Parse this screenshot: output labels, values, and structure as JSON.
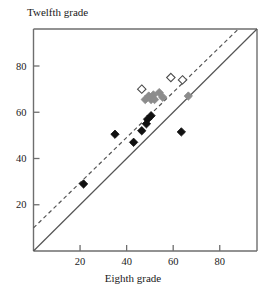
{
  "chart_data": {
    "type": "scatter",
    "title": "",
    "xlabel": "Eighth grade",
    "ylabel": "Twelfth grade",
    "xlim": [
      0,
      96
    ],
    "ylim": [
      0,
      96
    ],
    "xticks": [
      20,
      40,
      60,
      80
    ],
    "yticks": [
      20,
      40,
      60,
      80
    ],
    "grid": false,
    "legend": "none",
    "series": [
      {
        "name": "filled-diamond",
        "marker": "filled diamond",
        "color": "#111111",
        "points": [
          {
            "x": 21.5,
            "y": 29.0
          },
          {
            "x": 35.0,
            "y": 50.5
          },
          {
            "x": 43.0,
            "y": 47.0
          },
          {
            "x": 46.5,
            "y": 52.0
          },
          {
            "x": 48.5,
            "y": 55.0
          },
          {
            "x": 49.0,
            "y": 57.0
          },
          {
            "x": 50.5,
            "y": 58.5
          },
          {
            "x": 63.5,
            "y": 51.5
          }
        ]
      },
      {
        "name": "gray-diamond",
        "marker": "gray filled diamond",
        "color": "#8c8c8c",
        "points": [
          {
            "x": 48.0,
            "y": 65.5
          },
          {
            "x": 49.5,
            "y": 67.0
          },
          {
            "x": 50.5,
            "y": 65.5
          },
          {
            "x": 51.5,
            "y": 67.5
          },
          {
            "x": 52.0,
            "y": 65.5
          },
          {
            "x": 54.0,
            "y": 68.5
          },
          {
            "x": 55.5,
            "y": 66.5
          },
          {
            "x": 66.5,
            "y": 67.0
          }
        ]
      },
      {
        "name": "open-diamond",
        "marker": "open diamond",
        "color": "#ffffff",
        "points": [
          {
            "x": 46.5,
            "y": 70.0
          },
          {
            "x": 59.0,
            "y": 75.0
          },
          {
            "x": 64.0,
            "y": 74.0
          }
        ]
      }
    ],
    "lines": [
      {
        "name": "identity-line",
        "style": "solid",
        "color": "#555555",
        "from": {
          "x": 0,
          "y": 0
        },
        "to": {
          "x": 96,
          "y": 96
        }
      },
      {
        "name": "regression-line",
        "style": "dashed",
        "color": "#555555",
        "from": {
          "x": 0,
          "y": 10
        },
        "to": {
          "x": 88,
          "y": 96
        }
      }
    ]
  },
  "axes": {
    "x_title": "Eighth grade",
    "y_title": "Twelfth grade",
    "x_tick_labels": [
      "20",
      "40",
      "60",
      "80"
    ],
    "y_tick_labels": [
      "20",
      "40",
      "60",
      "80"
    ]
  }
}
